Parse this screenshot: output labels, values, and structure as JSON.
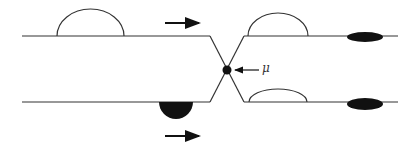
{
  "diagram": {
    "label_mu": "μ",
    "colors": {
      "line": "#333333",
      "fill_dark": "#111111",
      "background": "#ffffff"
    },
    "arrows": [
      {
        "name": "flow-arrow-top",
        "direction": "right"
      },
      {
        "name": "flow-arrow-bottom",
        "direction": "right"
      },
      {
        "name": "mu-pointer-arrow",
        "direction": "left"
      }
    ]
  }
}
